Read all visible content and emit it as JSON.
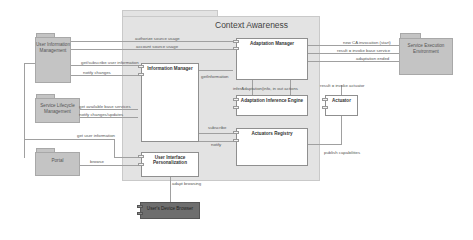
{
  "diagram": {
    "title": "Context Awareness",
    "external_packages": [
      {
        "id": "user-info-mgmt",
        "label": "User Information Management"
      },
      {
        "id": "service-lifecycle-mgmt",
        "label": "Service Lifecycle Management"
      },
      {
        "id": "portal",
        "label": "Portal"
      },
      {
        "id": "service-exec-env",
        "label": "Service Execution Environment"
      }
    ],
    "components": [
      {
        "id": "adaptation-manager",
        "label": "Adaptation Manager"
      },
      {
        "id": "information-manager",
        "label": "Information Manager"
      },
      {
        "id": "adaptation-inference-engine",
        "label": "Adaptation Inference Engine"
      },
      {
        "id": "actuator",
        "label": "Actuator"
      },
      {
        "id": "actuators-registry",
        "label": "Actuators Registry"
      },
      {
        "id": "ui-personalization",
        "label": "User Interface Personalization"
      }
    ],
    "external_component": {
      "label": "User's Device Browser"
    },
    "connectors": [
      {
        "label": "authorize source usage"
      },
      {
        "label": "account source usage"
      },
      {
        "label": "get/subscribe user information"
      },
      {
        "label": "notify changes"
      },
      {
        "label": "getInformation"
      },
      {
        "label": "get available base services"
      },
      {
        "label": "notify changes/updates"
      },
      {
        "label": "get user information"
      },
      {
        "label": "browse"
      },
      {
        "label": "inferAdaptation(info, in out actions"
      },
      {
        "label": "subscribe"
      },
      {
        "label": "notify"
      },
      {
        "label": "new CA invocation (start)"
      },
      {
        "label": "result = invoke base service"
      },
      {
        "label": "adaptation ended"
      },
      {
        "label": "result = invoke actuator"
      },
      {
        "label": "publish capabilities"
      },
      {
        "label": "adapt browsing"
      }
    ]
  }
}
